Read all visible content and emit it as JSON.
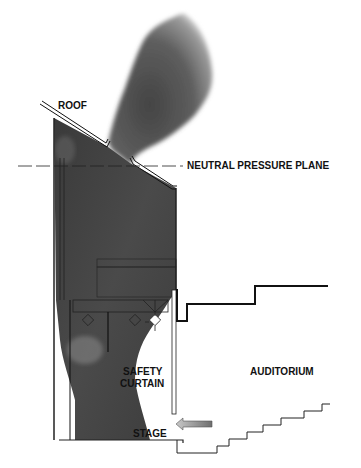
{
  "diagram": {
    "labels": {
      "roof": "ROOF",
      "neutral_pressure_plane": "NEUTRAL PRESSURE PLANE",
      "safety_curtain_line1": "SAFETY",
      "safety_curtain_line2": "CURTAIN",
      "auditorium": "AUDITORIUM",
      "stage": "STAGE"
    },
    "colors": {
      "smoke_dark": "#3a3a3a",
      "smoke_mid": "#6a6a6a",
      "smoke_light": "#b0b0b0",
      "line": "#111111",
      "arrow": "#8a8a8a"
    }
  }
}
